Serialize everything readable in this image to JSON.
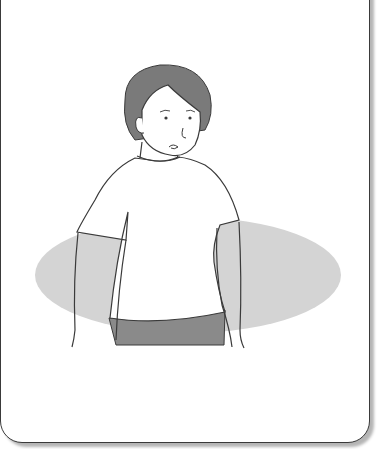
{
  "illustration": {
    "subject": "person-standing-shirt-shorts",
    "colors": {
      "background": "#ffffff",
      "outline": "#3a3a3a",
      "hair": "#7a7a7a",
      "shorts": "#8a8a8a",
      "shadow_ellipse": "#d4d4d4",
      "card_shadow": "#b5b5b5"
    }
  }
}
